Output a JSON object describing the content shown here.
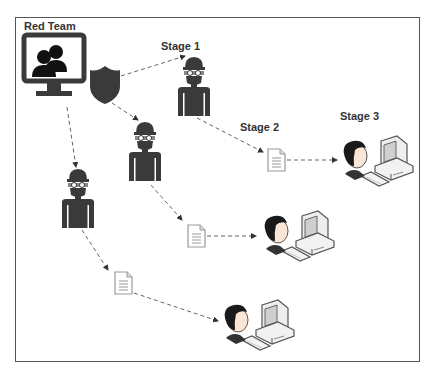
{
  "diagram": {
    "title": "Red Team",
    "stages": [
      {
        "id": "stage1",
        "label": "Stage 1"
      },
      {
        "id": "stage2",
        "label": "Stage 2"
      },
      {
        "id": "stage3",
        "label": "Stage 3"
      }
    ],
    "nodes": {
      "source": {
        "label": "Red Team",
        "icons": [
          "monitor-icon",
          "users-icon",
          "shield-icon"
        ]
      },
      "attackers": [
        {
          "id": "attacker-1",
          "icon": "hacker-icon"
        },
        {
          "id": "attacker-2",
          "icon": "hacker-icon"
        },
        {
          "id": "attacker-3",
          "icon": "hacker-icon"
        }
      ],
      "payloads": [
        {
          "id": "document-1",
          "icon": "document-icon"
        },
        {
          "id": "document-2",
          "icon": "document-icon"
        },
        {
          "id": "document-3",
          "icon": "document-icon"
        }
      ],
      "targets": [
        {
          "id": "victim-1",
          "icon": "user-workstation-icon"
        },
        {
          "id": "victim-2",
          "icon": "user-workstation-icon"
        },
        {
          "id": "victim-3",
          "icon": "user-workstation-icon"
        }
      ]
    },
    "edges": [
      {
        "from": "source",
        "to": "attacker-1",
        "style": "dashed-arrow"
      },
      {
        "from": "source",
        "to": "attacker-2",
        "style": "dashed-arrow"
      },
      {
        "from": "source",
        "to": "attacker-3",
        "style": "dashed-arrow"
      },
      {
        "from": "attacker-1",
        "to": "document-1",
        "style": "dashed-arrow"
      },
      {
        "from": "attacker-2",
        "to": "document-2",
        "style": "dashed-arrow"
      },
      {
        "from": "attacker-3",
        "to": "document-3",
        "style": "dashed-arrow"
      },
      {
        "from": "document-1",
        "to": "victim-1",
        "style": "dashed-arrow"
      },
      {
        "from": "document-2",
        "to": "victim-2",
        "style": "dashed-arrow"
      },
      {
        "from": "document-3",
        "to": "victim-3",
        "style": "dashed-arrow"
      }
    ],
    "colors": {
      "icon_dark": "#3a3a3a",
      "frame": "#555555",
      "arrow": "#666666",
      "document": "#9a9a9a"
    }
  }
}
